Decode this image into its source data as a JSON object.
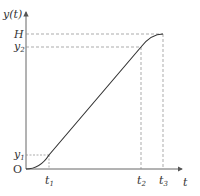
{
  "diagram": {
    "type": "function-graph",
    "axes": {
      "y_label": "y(t)",
      "x_label": "t",
      "origin_label": "O"
    },
    "y_ticks": [
      {
        "label": "H",
        "name": "H"
      },
      {
        "label": "y",
        "sub": "2",
        "name": "y2"
      },
      {
        "label": "y",
        "sub": "1",
        "name": "y1"
      }
    ],
    "x_ticks": [
      {
        "label": "t",
        "sub": "1",
        "name": "t1"
      },
      {
        "label": "t",
        "sub": "2",
        "name": "t2"
      },
      {
        "label": "t",
        "sub": "3",
        "name": "t3"
      }
    ],
    "colors": {
      "axis": "#555555",
      "curve": "#333333",
      "guide": "#888888"
    }
  }
}
